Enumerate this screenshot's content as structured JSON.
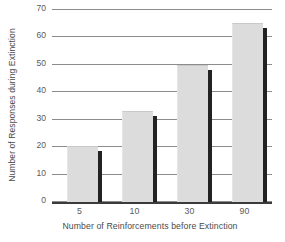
{
  "chart_data": {
    "type": "bar",
    "title": "",
    "categories": [
      "5",
      "10",
      "30",
      "90"
    ],
    "values": [
      20,
      33,
      49.5,
      65
    ],
    "series": [
      {
        "name": "Number of Responses during Extinction",
        "values": [
          20,
          33,
          49.5,
          65
        ]
      }
    ],
    "xlabel": "Number of Reinforcements before Extinction",
    "ylabel": "Number of Responses during Extinction",
    "ylim": [
      0,
      70
    ],
    "ytick_labels": [
      "0",
      "10",
      "20",
      "30",
      "40",
      "50",
      "60",
      "70"
    ],
    "ytick_values": [
      0,
      10,
      20,
      30,
      40,
      50,
      60,
      70
    ],
    "grid": true,
    "legend": "none",
    "bar_color": "#dcdcdc",
    "bar_shadow_color": "#222222",
    "grid_color": "#8c8c8c",
    "axis_color": "#3b3b3b",
    "text_color": "#4a4a4a"
  }
}
